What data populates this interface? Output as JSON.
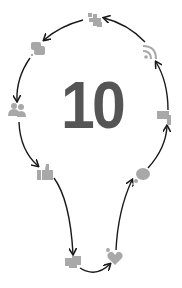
{
  "diagram": {
    "center_number": "10",
    "colors": {
      "number": "#555555",
      "icon": "#a8a8a8",
      "arrow": "#1a1a1a",
      "background": "#ffffff"
    },
    "nodes": [
      {
        "id": "puzzle",
        "icon": "puzzle-sparkle-icon",
        "x": 95,
        "y": 20
      },
      {
        "id": "chat",
        "icon": "chat-bubbles-icon",
        "x": 37,
        "y": 48
      },
      {
        "id": "people",
        "icon": "people-icon",
        "x": 17,
        "y": 110
      },
      {
        "id": "thumbs-up",
        "icon": "thumbs-up-icon",
        "x": 45,
        "y": 173
      },
      {
        "id": "handshake",
        "icon": "handshake-icon",
        "x": 73,
        "y": 262
      },
      {
        "id": "heart",
        "icon": "heart-icon",
        "x": 115,
        "y": 258
      },
      {
        "id": "speech",
        "icon": "speech-bubble-icon",
        "x": 142,
        "y": 176
      },
      {
        "id": "flag",
        "icon": "flag-icon",
        "x": 165,
        "y": 117
      },
      {
        "id": "rss",
        "icon": "rss-icon",
        "x": 150,
        "y": 52
      }
    ],
    "flow_order": [
      "heart",
      "speech",
      "flag",
      "rss",
      "puzzle",
      "chat",
      "people",
      "thumbs-up",
      "handshake",
      "heart"
    ]
  }
}
